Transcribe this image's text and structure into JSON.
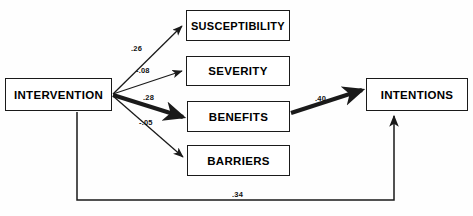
{
  "diagram": {
    "type": "path-diagram",
    "background_color": "#fefefe",
    "line_color": "#1a1a1a",
    "nodes": [
      {
        "id": "intervention",
        "label": "INTERVENTION",
        "x": 5,
        "y": 78,
        "w": 107,
        "h": 33
      },
      {
        "id": "susceptibility",
        "label": "SUSCEPTIBILITY",
        "x": 186,
        "y": 10,
        "w": 104,
        "h": 31
      },
      {
        "id": "severity",
        "label": "SEVERITY",
        "x": 186,
        "y": 56,
        "w": 104,
        "h": 30
      },
      {
        "id": "benefits",
        "label": "BENEFITS",
        "x": 187,
        "y": 101,
        "w": 103,
        "h": 31
      },
      {
        "id": "barriers",
        "label": "BARRIERS",
        "x": 187,
        "y": 145,
        "w": 103,
        "h": 31
      },
      {
        "id": "intentions",
        "label": "INTENTIONS",
        "x": 366,
        "y": 78,
        "w": 102,
        "h": 33
      }
    ],
    "edges": [
      {
        "id": "int-sus",
        "from": "intervention",
        "to": "susceptibility",
        "coefficient": ".26",
        "weight": "thin",
        "label_x": 131,
        "label_y": 44
      },
      {
        "id": "int-sev",
        "from": "intervention",
        "to": "severity",
        "coefficient": "-.08",
        "weight": "thin",
        "label_x": 136,
        "label_y": 66
      },
      {
        "id": "int-ben",
        "from": "intervention",
        "to": "benefits",
        "coefficient": ".28",
        "weight": "bold",
        "label_x": 143,
        "label_y": 93
      },
      {
        "id": "int-bar",
        "from": "intervention",
        "to": "barriers",
        "coefficient": "-.05",
        "weight": "thin",
        "label_x": 139,
        "label_y": 118
      },
      {
        "id": "ben-inte",
        "from": "benefits",
        "to": "intentions",
        "coefficient": ".40",
        "weight": "bold",
        "label_x": 315,
        "label_y": 94
      },
      {
        "id": "int-inte",
        "from": "intervention",
        "to": "intentions",
        "coefficient": ".34",
        "weight": "thin",
        "label_x": 232,
        "label_y": 190
      }
    ]
  }
}
